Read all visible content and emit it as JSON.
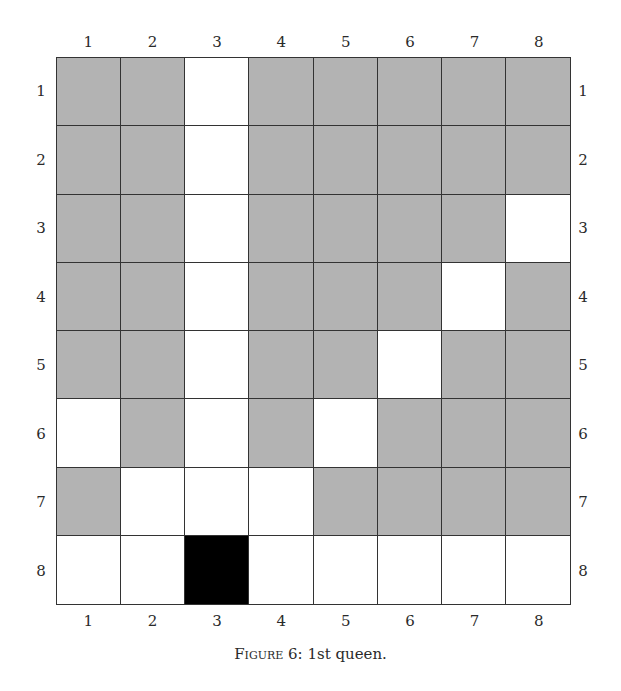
{
  "figure": {
    "caption_prefix": "Figure 6",
    "caption_text": ": 1st queen."
  },
  "columns": [
    "1",
    "2",
    "3",
    "4",
    "5",
    "6",
    "7",
    "8"
  ],
  "rows": [
    "1",
    "2",
    "3",
    "4",
    "5",
    "6",
    "7",
    "8"
  ],
  "legend_states": {
    "attacked": "#b3b3b3",
    "free": "#ffffff",
    "queen": "#000000"
  },
  "board": [
    [
      "attacked",
      "attacked",
      "free",
      "attacked",
      "attacked",
      "attacked",
      "attacked",
      "attacked"
    ],
    [
      "attacked",
      "attacked",
      "free",
      "attacked",
      "attacked",
      "attacked",
      "attacked",
      "attacked"
    ],
    [
      "attacked",
      "attacked",
      "free",
      "attacked",
      "attacked",
      "attacked",
      "attacked",
      "free"
    ],
    [
      "attacked",
      "attacked",
      "free",
      "attacked",
      "attacked",
      "attacked",
      "free",
      "attacked"
    ],
    [
      "attacked",
      "attacked",
      "free",
      "attacked",
      "attacked",
      "free",
      "attacked",
      "attacked"
    ],
    [
      "free",
      "attacked",
      "free",
      "attacked",
      "free",
      "attacked",
      "attacked",
      "attacked"
    ],
    [
      "attacked",
      "free",
      "free",
      "free",
      "attacked",
      "attacked",
      "attacked",
      "attacked"
    ],
    [
      "free",
      "free",
      "queen",
      "free",
      "free",
      "free",
      "free",
      "free"
    ]
  ],
  "queen_position": {
    "row": 8,
    "col": 3
  }
}
